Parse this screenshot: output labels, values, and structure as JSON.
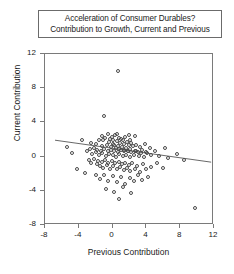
{
  "title": {
    "line1": "Acceleration of Consumer Durables?",
    "line2": "Contribution to Growth, Current and Previous"
  },
  "axes": {
    "x_label": "Previous Contribution",
    "y_label": "Current Contribution"
  },
  "colors": {
    "frame": "#7a7a7a",
    "marker": "#4a4a4a",
    "fit_line": "#555555",
    "text": "#1a1a1a"
  },
  "chart_data": {
    "type": "scatter",
    "title": "Acceleration of Consumer Durables? Contribution to Growth, Current and Previous",
    "xlabel": "Previous Contribution",
    "ylabel": "Current Contribution",
    "xlim": [
      -8,
      12
    ],
    "ylim": [
      -8,
      12
    ],
    "xticks": [
      -8,
      -4,
      0,
      4,
      8,
      12
    ],
    "yticks": [
      -8,
      -4,
      0,
      4,
      8,
      12
    ],
    "grid": false,
    "legend": null,
    "marker_style": "open-circle",
    "fit_line": {
      "present": true,
      "x_start": -6.8,
      "y_start": 1.8,
      "x_end": 11.9,
      "y_end": -0.8,
      "slope": -0.139,
      "intercept": 0.855
    },
    "points": [
      [
        0.6,
        10.0
      ],
      [
        -1.0,
        4.8
      ],
      [
        -1.2,
        2.4
      ],
      [
        0.5,
        2.6
      ],
      [
        1.9,
        2.5
      ],
      [
        2.6,
        2.4
      ],
      [
        -2.6,
        1.6
      ],
      [
        -2.0,
        1.5
      ],
      [
        -1.6,
        2.0
      ],
      [
        -1.3,
        1.2
      ],
      [
        -1.1,
        1.9
      ],
      [
        -0.9,
        2.2
      ],
      [
        -0.7,
        1.4
      ],
      [
        -0.6,
        2.7
      ],
      [
        -0.4,
        1.7
      ],
      [
        -0.3,
        2.1
      ],
      [
        -0.2,
        1.1
      ],
      [
        -0.1,
        2.3
      ],
      [
        0.0,
        1.5
      ],
      [
        0.1,
        2.0
      ],
      [
        0.2,
        1.3
      ],
      [
        0.3,
        2.5
      ],
      [
        0.4,
        1.0
      ],
      [
        0.5,
        1.8
      ],
      [
        0.6,
        1.2
      ],
      [
        0.7,
        2.2
      ],
      [
        0.8,
        0.9
      ],
      [
        0.9,
        1.6
      ],
      [
        1.0,
        2.1
      ],
      [
        1.1,
        1.1
      ],
      [
        1.2,
        1.9
      ],
      [
        1.3,
        0.8
      ],
      [
        1.4,
        1.5
      ],
      [
        1.5,
        2.3
      ],
      [
        1.6,
        1.0
      ],
      [
        1.7,
        1.7
      ],
      [
        1.8,
        0.6
      ],
      [
        1.9,
        1.3
      ],
      [
        2.0,
        2.0
      ],
      [
        2.1,
        0.9
      ],
      [
        2.2,
        1.6
      ],
      [
        2.4,
        1.2
      ],
      [
        2.6,
        0.7
      ],
      [
        2.8,
        1.4
      ],
      [
        3.0,
        0.5
      ],
      [
        3.2,
        1.1
      ],
      [
        3.5,
        0.8
      ],
      [
        3.8,
        1.5
      ],
      [
        4.1,
        0.4
      ],
      [
        4.4,
        1.0
      ],
      [
        -3.0,
        0.6
      ],
      [
        -2.7,
        0.9
      ],
      [
        -2.4,
        0.3
      ],
      [
        -2.2,
        1.0
      ],
      [
        -2.0,
        0.5
      ],
      [
        -1.8,
        0.8
      ],
      [
        -1.6,
        0.2
      ],
      [
        -1.4,
        0.7
      ],
      [
        -1.2,
        0.4
      ],
      [
        -1.0,
        0.9
      ],
      [
        -0.8,
        0.1
      ],
      [
        -0.6,
        0.6
      ],
      [
        -0.4,
        0.3
      ],
      [
        -0.2,
        0.8
      ],
      [
        0.0,
        0.2
      ],
      [
        0.2,
        0.7
      ],
      [
        0.4,
        0.0
      ],
      [
        0.6,
        0.5
      ],
      [
        0.8,
        0.3
      ],
      [
        1.0,
        0.8
      ],
      [
        1.2,
        0.1
      ],
      [
        1.4,
        0.6
      ],
      [
        1.6,
        0.2
      ],
      [
        1.8,
        0.7
      ],
      [
        2.0,
        0.0
      ],
      [
        2.2,
        0.5
      ],
      [
        2.5,
        0.2
      ],
      [
        2.8,
        0.6
      ],
      [
        3.1,
        0.1
      ],
      [
        3.4,
        0.4
      ],
      [
        3.7,
        0.0
      ],
      [
        4.0,
        0.5
      ],
      [
        4.5,
        0.2
      ],
      [
        5.0,
        0.6
      ],
      [
        5.5,
        0.1
      ],
      [
        -2.8,
        -0.4
      ],
      [
        -2.5,
        -0.8
      ],
      [
        -2.2,
        -0.3
      ],
      [
        -1.9,
        -0.9
      ],
      [
        -1.7,
        -0.5
      ],
      [
        -1.5,
        -1.1
      ],
      [
        -1.3,
        -0.6
      ],
      [
        -1.1,
        -1.3
      ],
      [
        -0.9,
        -0.4
      ],
      [
        -0.7,
        -1.0
      ],
      [
        -0.5,
        -0.7
      ],
      [
        -0.3,
        -1.4
      ],
      [
        -0.1,
        -0.5
      ],
      [
        0.1,
        -1.1
      ],
      [
        0.3,
        -0.8
      ],
      [
        0.5,
        -1.5
      ],
      [
        0.7,
        -0.6
      ],
      [
        0.9,
        -1.2
      ],
      [
        1.1,
        -0.9
      ],
      [
        1.3,
        -1.6
      ],
      [
        1.5,
        -0.7
      ],
      [
        1.7,
        -1.3
      ],
      [
        1.9,
        -1.0
      ],
      [
        2.1,
        -1.7
      ],
      [
        2.3,
        -0.8
      ],
      [
        2.6,
        -1.4
      ],
      [
        2.9,
        -1.1
      ],
      [
        3.2,
        -1.8
      ],
      [
        3.6,
        -0.9
      ],
      [
        4.0,
        -1.5
      ],
      [
        4.6,
        -1.2
      ],
      [
        5.2,
        -0.7
      ],
      [
        6.0,
        -1.3
      ],
      [
        -2.0,
        -2.2
      ],
      [
        -1.5,
        -2.6
      ],
      [
        -1.0,
        -2.1
      ],
      [
        -0.5,
        -2.8
      ],
      [
        0.0,
        -2.3
      ],
      [
        0.5,
        -3.0
      ],
      [
        1.0,
        -2.4
      ],
      [
        1.5,
        -3.2
      ],
      [
        2.0,
        -2.5
      ],
      [
        2.5,
        -2.9
      ],
      [
        3.0,
        -2.2
      ],
      [
        3.5,
        -2.7
      ],
      [
        4.2,
        -2.4
      ],
      [
        -0.8,
        -3.8
      ],
      [
        0.2,
        -4.1
      ],
      [
        1.2,
        -3.6
      ],
      [
        2.2,
        -4.3
      ],
      [
        0.8,
        -5.0
      ],
      [
        -4.2,
        -1.4
      ],
      [
        -4.8,
        0.4
      ],
      [
        -5.4,
        1.1
      ],
      [
        -3.6,
        2.0
      ],
      [
        -3.3,
        -1.9
      ],
      [
        9.7,
        -6.0
      ],
      [
        7.6,
        0.3
      ],
      [
        6.6,
        -0.2
      ],
      [
        6.2,
        1.0
      ],
      [
        8.4,
        -0.4
      ]
    ]
  }
}
